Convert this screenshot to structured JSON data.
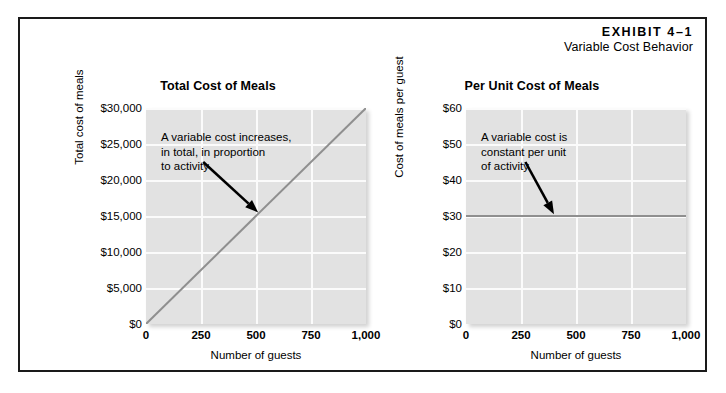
{
  "exhibit": {
    "number": "EXHIBIT 4–1",
    "subtitle": "Variable Cost Behavior"
  },
  "chart_data": [
    {
      "id": "total-cost-of-meals",
      "type": "line",
      "title": "Total Cost of Meals",
      "xlabel": "Number of guests",
      "ylabel": "Total cost of meals",
      "xlim": [
        0,
        1000
      ],
      "ylim": [
        0,
        30000
      ],
      "xticks": [
        0,
        250,
        500,
        750,
        1000
      ],
      "xtick_labels": [
        "0",
        "250",
        "500",
        "750",
        "1,000"
      ],
      "yticks": [
        0,
        5000,
        10000,
        15000,
        20000,
        25000,
        30000
      ],
      "ytick_labels": [
        "$0",
        "$5,000",
        "$10,000",
        "$15,000",
        "$20,000",
        "$25,000",
        "$30,000"
      ],
      "grid": true,
      "legend": "none",
      "series": [
        {
          "name": "Total cost of meals",
          "color": "#8f8f8f",
          "x": [
            0,
            1000
          ],
          "values": [
            0,
            30000
          ]
        }
      ],
      "annotation": "A variable cost increases,\nin total, in proportion\nto activity",
      "annotation_arrow": {
        "from_x": 260,
        "from_y": 22500,
        "to_x": 510,
        "to_y": 15500
      }
    },
    {
      "id": "per-unit-cost-of-meals",
      "type": "line",
      "title": "Per Unit Cost of Meals",
      "xlabel": "Number of guests",
      "ylabel": "Cost of meals per guest",
      "xlim": [
        0,
        1000
      ],
      "ylim": [
        0,
        60
      ],
      "xticks": [
        0,
        250,
        500,
        750,
        1000
      ],
      "xtick_labels": [
        "0",
        "250",
        "500",
        "750",
        "1,000"
      ],
      "yticks": [
        0,
        10,
        20,
        30,
        40,
        50,
        60
      ],
      "ytick_labels": [
        "$0",
        "$10",
        "$20",
        "$30",
        "$40",
        "$50",
        "$60"
      ],
      "grid": true,
      "legend": "none",
      "series": [
        {
          "name": "Cost of meals per guest",
          "color": "#8f8f8f",
          "x": [
            0,
            1000
          ],
          "values": [
            30,
            30
          ]
        }
      ],
      "annotation": "A variable cost is\nconstant per unit\nof activity",
      "annotation_arrow": {
        "from_x": 270,
        "from_y": 45,
        "to_x": 400,
        "to_y": 30.5
      }
    }
  ],
  "colors": {
    "plot_background": "#e2e2e2",
    "gridline": "#fbfbfb",
    "data_line": "#8f8f8f",
    "frame_border": "#1a1a1a",
    "text": "#000000",
    "page_background": "#ffffff"
  }
}
